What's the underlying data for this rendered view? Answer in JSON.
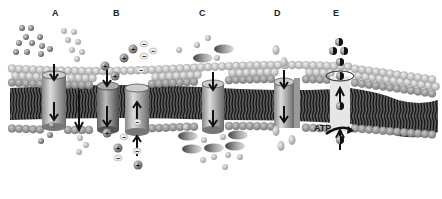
{
  "diagram": {
    "labels": [
      {
        "id": "A",
        "text": "A",
        "x": 55,
        "y": 13
      },
      {
        "id": "B",
        "text": "B",
        "x": 114,
        "y": 13
      },
      {
        "id": "C",
        "text": "C",
        "x": 199,
        "y": 13
      },
      {
        "id": "D",
        "text": "D",
        "x": 275,
        "y": 13
      },
      {
        "id": "E",
        "text": "E",
        "x": 333,
        "y": 13
      }
    ],
    "atp_label": "ATP",
    "ion_signs": {
      "positive": "+",
      "negative": "−"
    },
    "colors": {
      "background": "#ffffff",
      "head_light": "#d2d2d2",
      "head_dark": "#9a9a9a",
      "tail": "#2a2a2a",
      "channel": "#a8a8a8",
      "arrow": "#1e1e1e",
      "particle": "#8a8a8a"
    }
  }
}
